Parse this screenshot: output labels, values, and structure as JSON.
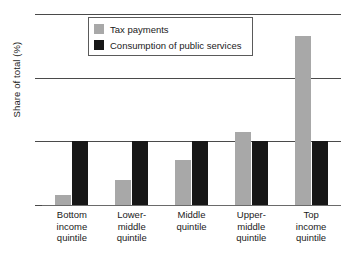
{
  "chart_data": {
    "type": "bar",
    "title": "",
    "xlabel": "",
    "ylabel": "Share of total (%)",
    "ylim": [
      0,
      60
    ],
    "yticks": [
      0,
      20,
      40,
      60
    ],
    "ytick_labels": [
      "0",
      "20",
      "40",
      "60"
    ],
    "grid": true,
    "legend_position": "top-center",
    "categories": [
      "Bottom income quintile",
      "Lower-middle quintile",
      "Middle quintile",
      "Upper-middle quintile",
      "Top income quintile"
    ],
    "category_lines": [
      [
        "Bottom",
        "income",
        "quintile"
      ],
      [
        "Lower-",
        "middle",
        "quintile"
      ],
      [
        "Middle",
        "quintile"
      ],
      [
        "Upper-",
        "middle",
        "quintile"
      ],
      [
        "Top",
        "income",
        "quintile"
      ]
    ],
    "series": [
      {
        "name": "Tax payments",
        "color": "#a8a8a8",
        "values": [
          3,
          8,
          14,
          23,
          53
        ]
      },
      {
        "name": "Consumption of public services",
        "color": "#171717",
        "values": [
          20,
          20,
          20,
          20,
          20
        ]
      }
    ]
  },
  "legend": {
    "items": [
      {
        "label": "Tax payments",
        "swatch": "series-tax"
      },
      {
        "label": "Consumption of public services",
        "swatch": "series-consumption"
      }
    ]
  }
}
